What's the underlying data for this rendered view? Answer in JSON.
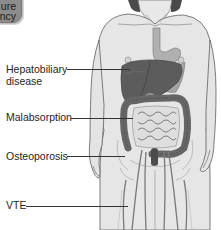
{
  "diagram": {
    "callout_box": {
      "line1": "ure",
      "line2": "ncy",
      "fill_color": "#8c8c8c"
    },
    "labels": [
      {
        "id": "hepatobiliary",
        "line1": "Hepatobiliary",
        "line2": "disease",
        "target": "liver"
      },
      {
        "id": "malabsorption",
        "text": "Malabsorption",
        "target": "small-intestine"
      },
      {
        "id": "osteoporosis",
        "text": "Osteoporosis",
        "target": "pelvis-femur"
      },
      {
        "id": "vte",
        "text": "VTE",
        "target": "leg-veins"
      }
    ],
    "colors": {
      "skin": "#e6e6e6",
      "outline": "#6e6e6e",
      "liver": "#5c5c5c",
      "stomach": "#a8a8a8",
      "colon": "#6a6a6a",
      "intestine": "#d9d9d9",
      "veins": "#7c7c7c",
      "hair": "#4a4a4a"
    }
  }
}
